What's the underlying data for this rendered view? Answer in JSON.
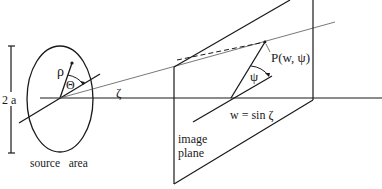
{
  "diagram": {
    "labels": {
      "aperture": "2 a",
      "rho": "ρ",
      "theta": "Θ",
      "zeta": "ζ",
      "point": "P(w, ψ)",
      "psi": "ψ",
      "w_eq": "w = sin ζ",
      "image_line1": "image",
      "image_line2": "plane",
      "source": "source   area"
    },
    "colors": {
      "stroke": "#1a1a1a",
      "thin_stroke": "#555555",
      "background": "#ffffff"
    }
  }
}
